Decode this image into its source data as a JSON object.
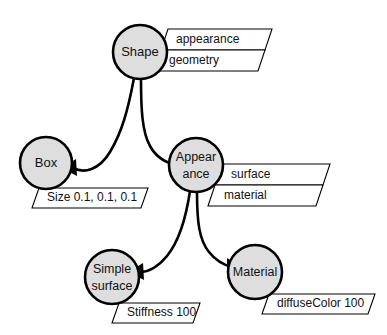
{
  "diagram": {
    "background_color": "#ffffff",
    "node_fill_color": "#dedede",
    "node_stroke_color": "#000000",
    "attribute_fill_color": "#ffffff",
    "nodes": [
      {
        "id": "shape",
        "label_line1": "Shape",
        "label_line2": ""
      },
      {
        "id": "box",
        "label_line1": "Box",
        "label_line2": ""
      },
      {
        "id": "appearance",
        "label_line1": "Appear",
        "label_line2": "ance"
      },
      {
        "id": "simple_surface",
        "label_line1": "Simple",
        "label_line2": "surface"
      },
      {
        "id": "material",
        "label_line1": "Material",
        "label_line2": ""
      }
    ],
    "attributes": [
      {
        "id": "shape_appearance",
        "text": "appearance"
      },
      {
        "id": "shape_geometry",
        "text": "geometry"
      },
      {
        "id": "appearance_surface",
        "text": "surface"
      },
      {
        "id": "appearance_material",
        "text": "material"
      },
      {
        "id": "box_size",
        "text": "Size 0.1, 0.1, 0.1"
      },
      {
        "id": "surface_stiffness",
        "text": "Stiffness 100"
      },
      {
        "id": "material_diffuse",
        "text": "diffuseColor 100"
      }
    ],
    "edges": [
      {
        "id": "shape-to-box",
        "from": "Shape",
        "to": "Box"
      },
      {
        "id": "shape-to-appearance",
        "from": "Shape",
        "to": "Appearance"
      },
      {
        "id": "appearance-to-simplesurface",
        "from": "Appearance",
        "to": "Simple surface"
      },
      {
        "id": "appearance-to-material",
        "from": "Appearance",
        "to": "Material"
      }
    ]
  }
}
